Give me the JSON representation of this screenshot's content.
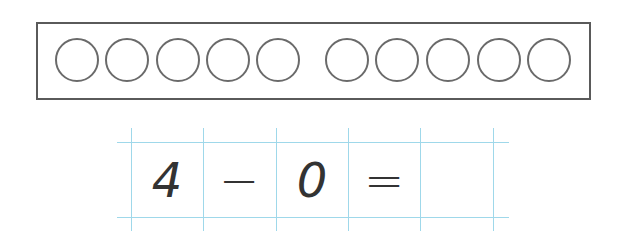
{
  "ten_frame": {
    "circles_left_group": 5,
    "circles_right_group": 5,
    "filled": 0,
    "circle_centers_x": [
      77,
      127,
      178,
      228,
      278,
      347,
      397,
      448,
      499,
      549
    ],
    "circle_center_y": 60
  },
  "equation": {
    "cells": [
      "4",
      "−",
      "0",
      "=",
      ""
    ],
    "answer_blank": true
  },
  "colors": {
    "frame_stroke": "#5a5a5a",
    "circle_stroke": "#6a6a6a",
    "grid_line": "#9fd8ea",
    "text": "#333333"
  }
}
